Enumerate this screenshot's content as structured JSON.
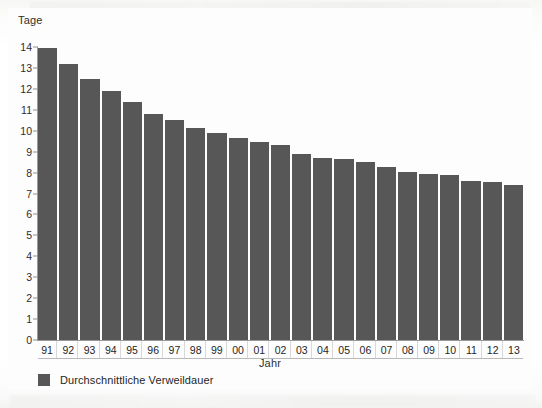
{
  "chart_data": {
    "type": "bar",
    "title": "",
    "xlabel": "Jahr",
    "ylabel": "Tage",
    "ylim": [
      0,
      14
    ],
    "y_ticks": [
      0,
      1,
      2,
      3,
      4,
      5,
      6,
      7,
      8,
      9,
      10,
      11,
      12,
      13,
      14
    ],
    "y_tick_labels": [
      "0",
      "1",
      "2",
      "3",
      "4",
      "5",
      "6",
      "7",
      "8",
      "9",
      "10",
      "11",
      "12",
      "13",
      "14"
    ],
    "grid": false,
    "legend_position": "bottom-left",
    "categories": [
      "91",
      "92",
      "93",
      "94",
      "95",
      "96",
      "97",
      "98",
      "99",
      "00",
      "01",
      "02",
      "03",
      "04",
      "05",
      "06",
      "07",
      "08",
      "09",
      "10",
      "11",
      "12",
      "13"
    ],
    "series": [
      {
        "name": "Durchschnittliche Verweildauer",
        "color": "#575757",
        "values": [
          13.95,
          13.2,
          12.45,
          11.9,
          11.35,
          10.8,
          10.5,
          10.15,
          9.9,
          9.65,
          9.45,
          9.3,
          8.9,
          8.7,
          8.65,
          8.5,
          8.25,
          8.05,
          7.95,
          7.9,
          7.6,
          7.55,
          7.4
        ]
      }
    ]
  },
  "legend": {
    "label": "Durchschnittliche Verweildauer"
  },
  "colors": {
    "bar": "#575757",
    "axis": "#9a9a9a",
    "text": "#2d2d2d",
    "background": "#ffffff"
  }
}
